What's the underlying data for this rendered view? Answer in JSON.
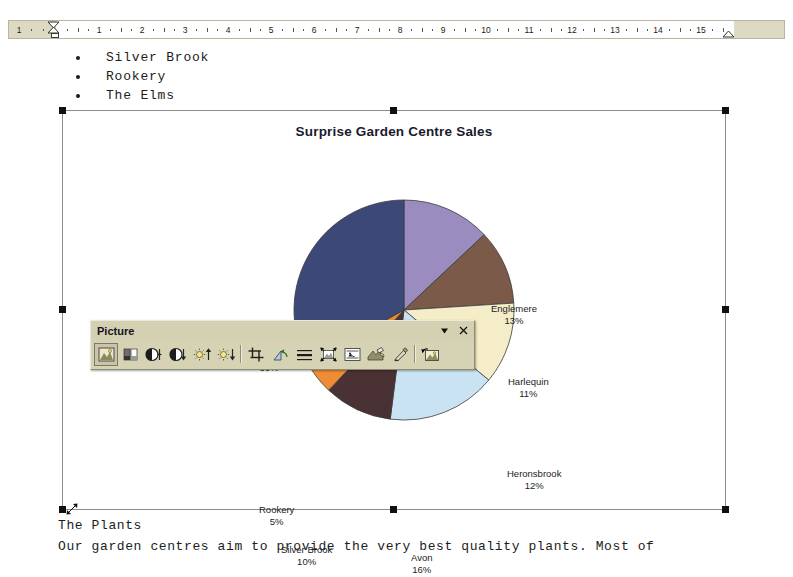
{
  "ruler": {
    "unit_labels": [
      "1",
      "1",
      "2",
      "3",
      "4",
      "5",
      "6",
      "7",
      "8",
      "9",
      "10",
      "11",
      "12",
      "13",
      "14",
      "15"
    ],
    "first_line_indent_icon": "first-line-indent-marker",
    "hanging_indent_icon": "hanging-indent-marker",
    "left_indent_icon": "left-indent-marker",
    "right_indent_icon": "right-indent-marker",
    "margin_color": "#ded9c3"
  },
  "document": {
    "bullet_items": [
      "Silver Brook",
      "Rookery",
      "The Elms"
    ],
    "paragraphs": [
      "The Plants",
      "Our garden centres aim to provide the very best quality plants.  Most of"
    ]
  },
  "chart_object": {
    "selected": true,
    "handle_color": "#101010",
    "border_color": "#8d8d8d",
    "resize_cursor_icon": "resize-diagonal-icon"
  },
  "chart_data": {
    "type": "pie",
    "title": "Surprise Garden Centre Sales",
    "xlabel": "",
    "ylabel": "",
    "legend_position": "none",
    "labels_show_percent": true,
    "categories": [
      "Englemere",
      "Harlequin",
      "Heronsbrook",
      "Avon",
      "Silver Brook",
      "Rookery",
      "The Elms"
    ],
    "values": [
      13,
      11,
      12,
      16,
      10,
      5,
      33
    ],
    "value_labels": [
      "13%",
      "11%",
      "12%",
      "16%",
      "10%",
      "5%",
      "33%"
    ],
    "colors": [
      "#9b8cc0",
      "#7b5a4a",
      "#f4edc8",
      "#c9e3f2",
      "#4a3234",
      "#ef8c35",
      "#3c4878"
    ],
    "start_angle_deg": 0
  },
  "picture_toolbar": {
    "title": "Picture",
    "dropdown_icon": "toolbar-options-chevron-icon",
    "close_icon": "close-icon",
    "buttons": [
      {
        "name": "insert-picture-icon",
        "label": "Insert Picture From File",
        "pressed": true
      },
      {
        "name": "image-control-icon",
        "label": "Color"
      },
      {
        "name": "more-contrast-icon",
        "label": "More Contrast"
      },
      {
        "name": "less-contrast-icon",
        "label": "Less Contrast"
      },
      {
        "name": "more-brightness-icon",
        "label": "More Brightness"
      },
      {
        "name": "less-brightness-icon",
        "label": "Less Brightness"
      },
      {
        "name": "crop-icon",
        "label": "Crop"
      },
      {
        "name": "rotate-left-icon",
        "label": "Rotate Left 90°"
      },
      {
        "name": "line-style-icon",
        "label": "Line Style"
      },
      {
        "name": "compress-pictures-icon",
        "label": "Compress Pictures"
      },
      {
        "name": "text-wrapping-icon",
        "label": "Text Wrapping"
      },
      {
        "name": "format-picture-icon",
        "label": "Format Picture"
      },
      {
        "name": "set-transparent-color-icon",
        "label": "Set Transparent Color"
      },
      {
        "name": "reset-picture-icon",
        "label": "Reset Picture"
      }
    ]
  }
}
